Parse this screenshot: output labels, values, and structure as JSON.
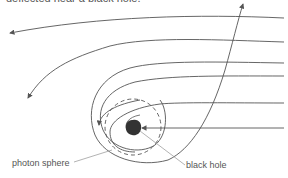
{
  "caption": "deflected near a black hole.",
  "labels": {
    "photon_sphere": "photon sphere",
    "black_hole": "black hole"
  },
  "colors": {
    "line": "#555555",
    "pointer": "#a0a0a0",
    "black_hole": "#333333"
  }
}
